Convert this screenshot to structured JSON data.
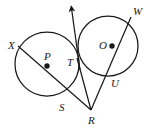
{
  "figure": {
    "kind": "geometry-diagram",
    "background_color": "#ffffff",
    "stroke_color": "#1a1a1a"
  },
  "labels": [
    {
      "id": "X",
      "text": "X",
      "x": 8,
      "y": 40
    },
    {
      "id": "P",
      "text": "P",
      "x": 44,
      "y": 51
    },
    {
      "id": "T",
      "text": "T",
      "x": 67,
      "y": 57
    },
    {
      "id": "O",
      "text": "O",
      "x": 99,
      "y": 40
    },
    {
      "id": "W",
      "text": "W",
      "x": 133,
      "y": 6
    },
    {
      "id": "U",
      "text": "U",
      "x": 111,
      "y": 78
    },
    {
      "id": "S",
      "text": "S",
      "x": 59,
      "y": 102
    },
    {
      "id": "R",
      "text": "R",
      "x": 88,
      "y": 115
    }
  ],
  "circles": [
    {
      "id": "circle-P",
      "center_label": "P",
      "cx": 47,
      "cy": 64,
      "r": 32
    },
    {
      "id": "circle-O",
      "center_label": "O",
      "cx": 108,
      "cy": 46,
      "r": 30
    }
  ],
  "center_dots": [
    {
      "id": "dot-P",
      "cx": 47,
      "cy": 66,
      "r": 2.7
    },
    {
      "id": "dot-O",
      "cx": 112,
      "cy": 46,
      "r": 2.7
    }
  ],
  "tangent_point": {
    "id": "T",
    "x": 77,
    "y": 58
  },
  "external_point": {
    "id": "R",
    "x": 91,
    "y": 110
  },
  "segments": [
    {
      "id": "secant-X-S-R",
      "from": "X",
      "to": "R",
      "x1": 18,
      "y1": 46,
      "x2": 91,
      "y2": 110
    },
    {
      "id": "secant-W-U-R",
      "from": "W",
      "to": "R",
      "x1": 131,
      "y1": 17,
      "x2": 91,
      "y2": 110
    },
    {
      "id": "tangent-T-R",
      "from": "T",
      "to": "R",
      "x1": 77,
      "y2": 110,
      "y1": 58,
      "x2": 91
    }
  ],
  "arrow_ray": {
    "id": "tangent-ray-T-up",
    "from_x": 79,
    "from_y": 66,
    "to_x": 71,
    "to_y": 5,
    "has_arrowhead": true
  },
  "intersections": [
    {
      "id": "S",
      "x": 63,
      "y": 100,
      "on": "circle-P"
    },
    {
      "id": "U",
      "x": 108,
      "y": 74,
      "on": "circle-O"
    }
  ]
}
